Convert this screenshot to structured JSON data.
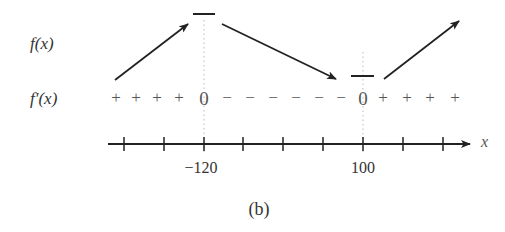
{
  "labels": {
    "f_row": "f(x)",
    "fprime_row": "f′(x)",
    "axis_var": "x",
    "caption": "(b)"
  },
  "sign_chart": {
    "symbols": [
      "+",
      "+",
      "+",
      "+",
      "0",
      "−",
      "−",
      "−",
      "−",
      "−",
      "−",
      "0",
      "+",
      "+",
      "+",
      "+"
    ],
    "critical_points": [
      "-120",
      "100"
    ],
    "behavior": [
      "increasing",
      "local max at -120",
      "decreasing",
      "local min at 100",
      "increasing"
    ]
  },
  "axis": {
    "tick_count": 9,
    "tick_labels": [
      {
        "value": "−120",
        "tick_index": 2
      },
      {
        "value": "100",
        "tick_index": 6
      }
    ]
  }
}
